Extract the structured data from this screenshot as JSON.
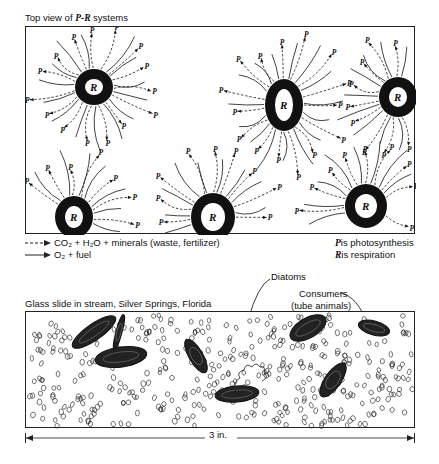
{
  "top_panel": {
    "title_prefix": "Top view of ",
    "title_var": "P-R",
    "title_suffix": " systems",
    "center_label": "R",
    "ray_label": "P",
    "systems": [
      {
        "cx": 68,
        "cy": 60,
        "rx": 15,
        "ry": 14
      },
      {
        "cx": 258,
        "cy": 78,
        "rx": 15,
        "ry": 22
      },
      {
        "cx": 372,
        "cy": 70,
        "rx": 15,
        "ry": 16
      },
      {
        "cx": 48,
        "cy": 190,
        "rx": 15,
        "ry": 17
      },
      {
        "cx": 187,
        "cy": 190,
        "rx": 18,
        "ry": 20
      },
      {
        "cx": 340,
        "cy": 179,
        "rx": 17,
        "ry": 18
      }
    ]
  },
  "legend": {
    "dashed_text": "CO₂ + H₂O + minerals (waste, fertilizer)",
    "solid_text": "O₂ + fuel",
    "p_def_var": "P",
    "p_def_text": " is photosynthesis",
    "r_def_var": "R",
    "r_def_text": " is respiration"
  },
  "bottom_panel": {
    "title": "Glass slide in stream, Silver Springs, Florida",
    "label_diatoms": "Diatoms",
    "label_consumers_1": "Consumers",
    "label_consumers_2": "(tube animals)",
    "scale_label": "3 in."
  }
}
